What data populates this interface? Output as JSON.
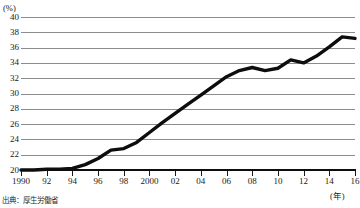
{
  "chart_data": {
    "type": "line",
    "title": "",
    "xlabel": "(年)",
    "ylabel": "(%)",
    "ylim": [
      20,
      40
    ],
    "xlim": [
      1990,
      2016
    ],
    "grid": true,
    "legend": null,
    "y_ticks": [
      40,
      38,
      36,
      34,
      32,
      30,
      28,
      26,
      24,
      22,
      20
    ],
    "x_ticks": [
      "1990",
      "92",
      "94",
      "96",
      "98",
      "2000",
      "02",
      "04",
      "06",
      "08",
      "10",
      "12",
      "14",
      "16"
    ],
    "x_tick_years": [
      1990,
      1992,
      1994,
      1996,
      1998,
      2000,
      2002,
      2004,
      2006,
      2008,
      2010,
      2012,
      2014,
      2016
    ],
    "series": [
      {
        "name": "",
        "x": [
          1990,
          1991,
          1992,
          1993,
          1994,
          1995,
          1996,
          1997,
          1998,
          1999,
          2000,
          2001,
          2002,
          2003,
          2004,
          2005,
          2006,
          2007,
          2008,
          2009,
          2010,
          2011,
          2012,
          2013,
          2014,
          2015,
          2016
        ],
        "values": [
          20.0,
          20.0,
          20.1,
          20.1,
          20.2,
          20.7,
          21.5,
          22.6,
          22.8,
          23.6,
          24.9,
          26.2,
          27.4,
          28.6,
          29.8,
          31.0,
          32.2,
          33.0,
          33.4,
          33.0,
          33.3,
          34.4,
          34.0,
          34.9,
          36.1,
          37.4,
          37.2
        ]
      }
    ],
    "line_color": "#0d0d0d",
    "grid_color": "#8c8c8c",
    "axis_color": "#0d0d0d"
  },
  "axes": {
    "y_unit": "(%)",
    "x_unit": "(年)"
  },
  "caption": {
    "source": "出典：厚生労働省"
  }
}
